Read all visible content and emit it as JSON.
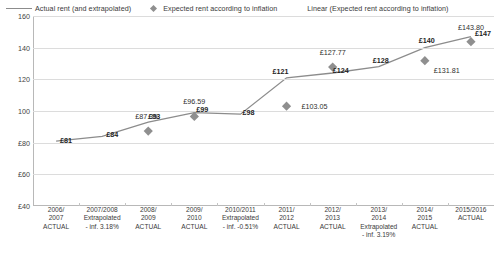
{
  "legend": {
    "items": [
      {
        "label": "Actual rent (and extrapolated)",
        "marker": "line-swatch",
        "color": "#8c8c8c"
      },
      {
        "label": "Expected rent according to inflation",
        "marker": "diamond-swatch",
        "color": "#8f8f8f"
      },
      {
        "label": "Linear (Expected rent according to inflation)",
        "marker": "none",
        "color": "#8c8c8c"
      }
    ]
  },
  "axis": {
    "y_ticks": [
      "160",
      "140",
      "120",
      "100",
      "£80",
      "£60",
      "£40"
    ],
    "y_min": 40,
    "y_max": 160
  },
  "chart_data": {
    "type": "line",
    "title": "",
    "xlabel": "",
    "ylabel": "",
    "ylim": [
      40,
      160
    ],
    "grid": true,
    "legend_position": "top",
    "categories": [
      "2006/ 2007 ACTUAL",
      "2007/2008 Extrapolated - inf. 3.18%",
      "2008/ 2009 ACTUAL",
      "2009/ 2010 ACTUAL",
      "2010/2011 Extrapolated - inf. -0.51%",
      "2011/ 2012 ACTUAL",
      "2012/ 2013 ACTUAL",
      "2013/ 2014 Extrapolated - inf. 3.19%",
      "2014/ 2015 ACTUAL",
      "2015/2016 ACTUAL"
    ],
    "category_lines": [
      [
        "2006/",
        "2007",
        "ACTUAL"
      ],
      [
        "2007/2008",
        "Extrapolated",
        "- inf. 3.18%"
      ],
      [
        "2008/",
        "2009",
        "ACTUAL"
      ],
      [
        "2009/",
        "2010",
        "ACTUAL"
      ],
      [
        "2010/2011",
        "Extrapolated",
        "- inf. -0.51%"
      ],
      [
        "2011/",
        "2012",
        "ACTUAL"
      ],
      [
        "2012/",
        "2013",
        "ACTUAL"
      ],
      [
        "2013/",
        "2014",
        "Extrapolated",
        "- inf. 3.19%"
      ],
      [
        "2014/",
        "2015",
        "ACTUAL"
      ],
      [
        "2015/2016",
        "ACTUAL"
      ]
    ],
    "series": [
      {
        "name": "Actual rent (and extrapolated)",
        "type": "line",
        "color": "#8c8c8c",
        "values": [
          81,
          84,
          93,
          99,
          98,
          121,
          124,
          128,
          140,
          147
        ],
        "labels": [
          "£81",
          "£84",
          "£93",
          "£99",
          "£98",
          "£121",
          "£124",
          "£128",
          "£140",
          "£147"
        ]
      },
      {
        "name": "Expected rent according to inflation",
        "type": "scatter",
        "marker": "diamond",
        "color": "#8f8f8f",
        "points": [
          {
            "x": 2,
            "y": 87.35,
            "label": "£87.35"
          },
          {
            "x": 3,
            "y": 96.59,
            "label": "£96.59"
          },
          {
            "x": 5,
            "y": 103.05,
            "label": "£103.05"
          },
          {
            "x": 6,
            "y": 127.77,
            "label": "£127.77"
          },
          {
            "x": 8,
            "y": 131.81,
            "label": "£131.81"
          },
          {
            "x": 9,
            "y": 143.8,
            "label": "£143.80"
          }
        ]
      }
    ]
  }
}
